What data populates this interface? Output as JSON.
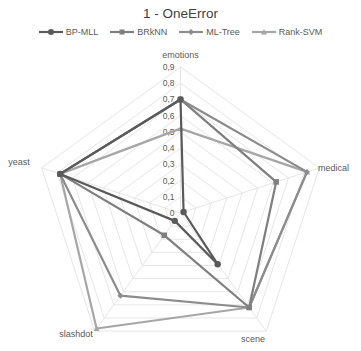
{
  "chart_data": {
    "type": "radar",
    "title": "1 - OneError",
    "categories": [
      "emotions",
      "medical",
      "scene",
      "slashdot",
      "yeast"
    ],
    "rlim": [
      0,
      0.9
    ],
    "ticks": [
      "0",
      "0,1",
      "0,2",
      "0,3",
      "0,4",
      "0,5",
      "0,6",
      "0,7",
      "0,8",
      "0,9"
    ],
    "grid": true,
    "legend_position": "top",
    "series": [
      {
        "name": "BP-MLL",
        "color": "#5a5a5a",
        "marker": "circle",
        "values": [
          0.7,
          0.02,
          0.39,
          0.06,
          0.78
        ]
      },
      {
        "name": "BRkNN",
        "color": "#7f7f7f",
        "marker": "square",
        "values": [
          0.7,
          0.62,
          0.72,
          0.17,
          0.78
        ]
      },
      {
        "name": "ML-Tree",
        "color": "#8c8c8c",
        "marker": "diamond",
        "values": [
          0.7,
          0.82,
          0.72,
          0.63,
          0.78
        ]
      },
      {
        "name": "Rank-SVM",
        "color": "#a6a6a6",
        "marker": "triangle",
        "values": [
          0.52,
          0.82,
          0.72,
          0.88,
          0.78
        ]
      }
    ]
  }
}
